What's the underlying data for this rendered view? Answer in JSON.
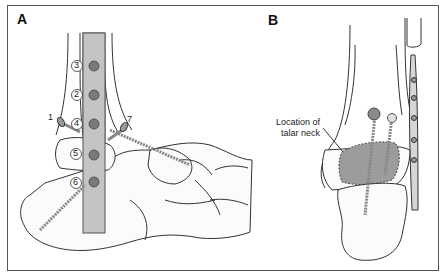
{
  "figure": {
    "panels": [
      {
        "label": "A",
        "screw_numbers": [
          "3",
          "2",
          "4",
          "5",
          "6"
        ],
        "side_labels": [
          "1",
          "7"
        ]
      },
      {
        "label": "B",
        "annotation_line1": "Location of",
        "annotation_line2": "talar neck"
      }
    ]
  },
  "colors": {
    "plate": "#b8b8b8",
    "screw_head": "#7a7a7a",
    "talar_neck_region": "#9a9a9a",
    "outline": "#333333"
  }
}
